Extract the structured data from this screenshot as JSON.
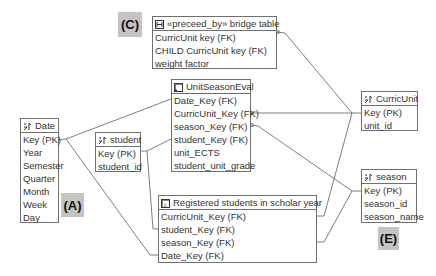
{
  "diagram": {
    "labels": {
      "A": "(A)",
      "C": "(C)",
      "D": "(D)",
      "E": "(E)"
    },
    "tables": {
      "bridge": {
        "icon": "bridge-table-icon",
        "title": "«preceed_by» bridge table",
        "rows": [
          "CurricUnit key (FK)",
          "CHILD CurricUnit key (FK)",
          "weight factor"
        ]
      },
      "unitSeasonEval": {
        "icon": "fact-table-icon",
        "title": "UnitSeasonEval",
        "rows": [
          "Date_Key (FK)",
          "CurricUnit_Key (FK)",
          "season_Key (FK)",
          "student_Key (FK)",
          "unit_ECTS",
          "student_unit_grade"
        ]
      },
      "date": {
        "icon": "dimension-icon",
        "title": "Date",
        "rows": [
          "Key (PK)",
          "Year",
          "Semester",
          "Quarter",
          "Month",
          "Week",
          "Day"
        ]
      },
      "student": {
        "icon": "dimension-icon",
        "title": "student",
        "rows": [
          "Key (PK)",
          "student_id"
        ]
      },
      "registered": {
        "icon": "factless-table-icon",
        "title": "Registered students in scholar year",
        "rows": [
          "CurricUnit_Key (FK)",
          "student_Key (FK)",
          "season_Key (FK)",
          "Date_Key (FK)"
        ]
      },
      "curricUnit": {
        "icon": "dimension-icon",
        "title": "CurricUnit",
        "rows": [
          "Key (PK)",
          "unit_id"
        ]
      },
      "season": {
        "icon": "dimension-icon",
        "title": "season",
        "rows": [
          "Key (PK)",
          "season_id",
          "season_name"
        ]
      }
    },
    "colors": {
      "line": "#6f6f6f",
      "border": "#6f6f6f",
      "tag_bg": "#c4c4c4",
      "text": "#333333"
    }
  }
}
